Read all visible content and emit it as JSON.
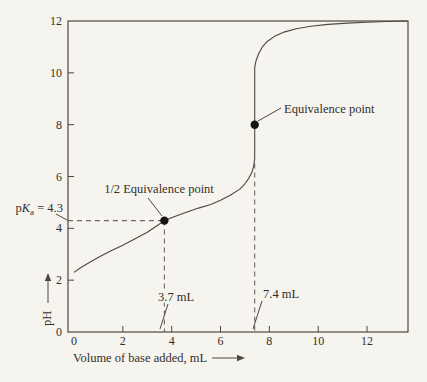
{
  "figure": {
    "background": "#f6f4ef",
    "ink": "#4c4840",
    "text": "#332f28",
    "dash": "#6e6a63",
    "marker": "#16140f"
  },
  "chart_data": {
    "type": "line",
    "xlabel": "Volume of base added, mL",
    "ylabel": "pH",
    "xlim": [
      0,
      13.7
    ],
    "ylim": [
      0,
      12
    ],
    "x_ticks": [
      0,
      2,
      4,
      6,
      8,
      10,
      12
    ],
    "y_ticks": [
      0,
      2,
      4,
      6,
      8,
      10,
      12
    ],
    "grid": false,
    "legend": false,
    "series": [
      {
        "name": "titration curve",
        "points": [
          [
            0,
            2.3
          ],
          [
            0.3,
            2.5
          ],
          [
            0.7,
            2.72
          ],
          [
            1.1,
            2.93
          ],
          [
            1.5,
            3.12
          ],
          [
            2,
            3.35
          ],
          [
            2.5,
            3.6
          ],
          [
            3,
            3.85
          ],
          [
            3.4,
            4.1
          ],
          [
            3.7,
            4.3
          ],
          [
            4.1,
            4.45
          ],
          [
            4.6,
            4.62
          ],
          [
            5.1,
            4.78
          ],
          [
            5.6,
            4.92
          ],
          [
            6,
            5.08
          ],
          [
            6.4,
            5.28
          ],
          [
            6.8,
            5.52
          ],
          [
            7,
            5.72
          ],
          [
            7.15,
            5.92
          ],
          [
            7.28,
            6.15
          ],
          [
            7.36,
            6.4
          ],
          [
            7.4,
            6.7
          ],
          [
            7.4,
            10.2
          ],
          [
            7.45,
            10.45
          ],
          [
            7.55,
            10.72
          ],
          [
            7.7,
            10.98
          ],
          [
            7.9,
            11.2
          ],
          [
            8.2,
            11.4
          ],
          [
            8.6,
            11.57
          ],
          [
            9.1,
            11.7
          ],
          [
            9.7,
            11.8
          ],
          [
            10.4,
            11.87
          ],
          [
            11.2,
            11.92
          ],
          [
            12,
            11.95
          ],
          [
            12.8,
            11.98
          ],
          [
            13.65,
            12
          ]
        ]
      }
    ],
    "markers": [
      {
        "name": "half-equivalence-point",
        "x": 3.7,
        "y": 4.3,
        "label": "1/2 Equivalence point"
      },
      {
        "name": "equivalence-point",
        "x": 7.4,
        "y": 8.0,
        "label": "Equivalence point"
      }
    ],
    "reference_lines": [
      {
        "name": "pka-horizontal-dashed",
        "style": "dashed",
        "from": [
          -0.25,
          4.3
        ],
        "to": [
          3.7,
          4.3
        ]
      },
      {
        "name": "half-equivalence-vertical-dashed",
        "style": "dashed",
        "from": [
          3.7,
          4.3
        ],
        "to": [
          3.7,
          0
        ]
      },
      {
        "name": "equivalence-vertical-dashed",
        "style": "dashed",
        "from": [
          7.4,
          6.5
        ],
        "to": [
          7.4,
          0
        ]
      }
    ],
    "annotations": {
      "equivalence": {
        "text": "Equivalence point"
      },
      "half_equivalence": {
        "text": "1/2 Equivalence point"
      },
      "pka": {
        "prefix": "p",
        "symbol": "K",
        "subscript": "a",
        "value": " = 4.3"
      },
      "volume_half": {
        "text": "3.7 mL"
      },
      "volume_eq": {
        "text": "7.4 mL"
      }
    }
  }
}
